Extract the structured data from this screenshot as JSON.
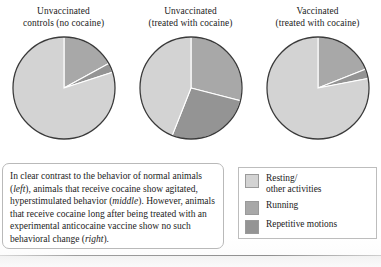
{
  "figure": {
    "panels": [
      {
        "title_line1": "Unvaccinated",
        "title_line2": "controls (no cocaine)"
      },
      {
        "title_line1": "Unvaccinated",
        "title_line2": "(treated with cocaine)"
      },
      {
        "title_line1": "Vaccinated",
        "title_line2": "(treated with cocaine)"
      }
    ],
    "caption": {
      "part1": "In clear contrast to the behavior of normal animals (",
      "em1": "left",
      "part2": "), animals that receive cocaine show agitated, hyperstimulated behavior (",
      "em2": "middle",
      "part3": "). However, animals that receive cocaine long after being treated with an experimental anticocaine vaccine show no such behavioral change (",
      "em3": "right",
      "part4": ")."
    },
    "legend": {
      "items": [
        {
          "label": "Resting/",
          "label2": "other activities",
          "color": "#d3d3d3"
        },
        {
          "label": "Running",
          "label2": "",
          "color": "#a8a8a8"
        },
        {
          "label": "Repetitive motions",
          "label2": "",
          "color": "#949494"
        }
      ]
    }
  },
  "chart_data": [
    {
      "type": "pie",
      "title": "Unvaccinated controls (no cocaine)",
      "categories": [
        "Resting/other activities",
        "Running",
        "Repetitive motions"
      ],
      "values": [
        80,
        17,
        3
      ],
      "colors": [
        "#d3d3d3",
        "#a8a8a8",
        "#949494"
      ],
      "start_angle": 0,
      "legend": "right"
    },
    {
      "type": "pie",
      "title": "Unvaccinated (treated with cocaine)",
      "categories": [
        "Resting/other activities",
        "Running",
        "Repetitive motions"
      ],
      "values": [
        44,
        29,
        27
      ],
      "colors": [
        "#d3d3d3",
        "#a8a8a8",
        "#949494"
      ],
      "start_angle": 0,
      "legend": "right"
    },
    {
      "type": "pie",
      "title": "Vaccinated (treated with cocaine)",
      "categories": [
        "Resting/other activities",
        "Running",
        "Repetitive motions"
      ],
      "values": [
        78,
        19,
        3
      ],
      "colors": [
        "#d3d3d3",
        "#a8a8a8",
        "#949494"
      ],
      "start_angle": 0,
      "legend": "right"
    }
  ]
}
